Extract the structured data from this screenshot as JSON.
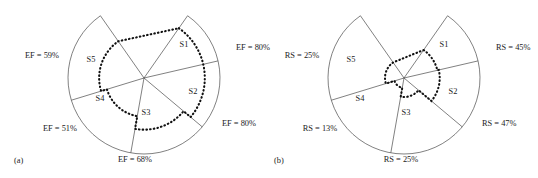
{
  "figure": {
    "panels": [
      {
        "caption": "(a)",
        "metric": "EF",
        "center": {
          "x": 144,
          "y": 78
        },
        "radius": 76,
        "sectors": [
          {
            "id": "S1",
            "label": "S1",
            "value_label": "EF = 80%",
            "value": 80,
            "a0": -55,
            "a1": -13,
            "label_pos": {
              "x": 184,
              "y": 47
            },
            "value_pos": {
              "x": 236,
              "y": 50
            },
            "value_anchor": "start"
          },
          {
            "id": "S2",
            "label": "S2",
            "value_label": "EF = 80%",
            "value": 80,
            "a0": -13,
            "a1": 40,
            "label_pos": {
              "x": 193,
              "y": 94
            },
            "value_pos": {
              "x": 222,
              "y": 126
            },
            "value_anchor": "start"
          },
          {
            "id": "S3",
            "label": "S3",
            "value_label": "EF = 68%",
            "value": 68,
            "a0": 40,
            "a1": 100,
            "label_pos": {
              "x": 146,
              "y": 115
            },
            "value_pos": {
              "x": 135,
              "y": 162
            },
            "value_anchor": "middle"
          },
          {
            "id": "S4",
            "label": "S4",
            "value_label": "EF = 51%",
            "value": 51,
            "a0": 100,
            "a1": 163,
            "label_pos": {
              "x": 100,
              "y": 101
            },
            "value_pos": {
              "x": 60,
              "y": 131
            },
            "value_anchor": "middle"
          },
          {
            "id": "S5",
            "label": "S5",
            "value_label": "EF = 59%",
            "value": 59,
            "a0": 163,
            "a1": 235,
            "label_pos": {
              "x": 91,
              "y": 62
            },
            "value_pos": {
              "x": 42,
              "y": 58
            },
            "value_anchor": "middle"
          }
        ]
      },
      {
        "caption": "(b)",
        "metric": "RS",
        "center": {
          "x": 404,
          "y": 78
        },
        "radius": 76,
        "sectors": [
          {
            "id": "S1",
            "label": "S1",
            "value_label": "RS = 45%",
            "value": 45,
            "a0": -55,
            "a1": -13,
            "label_pos": {
              "x": 444,
              "y": 47
            },
            "value_pos": {
              "x": 496,
              "y": 50
            },
            "value_anchor": "start"
          },
          {
            "id": "S2",
            "label": "S2",
            "value_label": "RS = 47%",
            "value": 47,
            "a0": -13,
            "a1": 40,
            "label_pos": {
              "x": 453,
              "y": 94
            },
            "value_pos": {
              "x": 482,
              "y": 126
            },
            "value_anchor": "start"
          },
          {
            "id": "S3",
            "label": "S3",
            "value_label": "RS = 25%",
            "value": 25,
            "a0": 40,
            "a1": 100,
            "label_pos": {
              "x": 406,
              "y": 115
            },
            "value_pos": {
              "x": 401,
              "y": 162
            },
            "value_anchor": "middle"
          },
          {
            "id": "S4",
            "label": "S4",
            "value_label": "RS = 13%",
            "value": 13,
            "a0": 100,
            "a1": 163,
            "label_pos": {
              "x": 360,
              "y": 101
            },
            "value_pos": {
              "x": 320,
              "y": 131
            },
            "value_anchor": "middle"
          },
          {
            "id": "S5",
            "label": "S5",
            "value_label": "RS = 25%",
            "value": 25,
            "a0": 163,
            "a1": 235,
            "label_pos": {
              "x": 351,
              "y": 62
            },
            "value_pos": {
              "x": 302,
              "y": 58
            },
            "value_anchor": "middle"
          }
        ]
      }
    ],
    "caption_positions": [
      {
        "x": 14,
        "y": 163
      },
      {
        "x": 274,
        "y": 163
      }
    ],
    "colors": {
      "line": "#4a4a4a",
      "dotted": "#111111",
      "text": "#1b1b1b",
      "background": "#ffffff"
    }
  },
  "chart_data": {
    "type": "radar",
    "title": "",
    "note": "Two sector (fan) radar diagrams; dotted closed curve marks the metric level inside each sector.",
    "categories": [
      "S1",
      "S2",
      "S3",
      "S4",
      "S5"
    ],
    "series": [
      {
        "name": "EF",
        "panel": "(a)",
        "values": [
          80,
          80,
          68,
          51,
          59
        ],
        "unit": "%"
      },
      {
        "name": "RS",
        "panel": "(b)",
        "values": [
          45,
          47,
          25,
          13,
          25
        ],
        "unit": "%"
      }
    ],
    "ylim": [
      0,
      100
    ],
    "grid": false,
    "legend": "none",
    "axis_labels": [
      "EF = 80%",
      "EF = 80%",
      "EF = 68%",
      "EF = 51%",
      "EF = 59%",
      "RS = 45%",
      "RS = 47%",
      "RS = 25%",
      "RS = 13%",
      "RS = 25%"
    ]
  }
}
